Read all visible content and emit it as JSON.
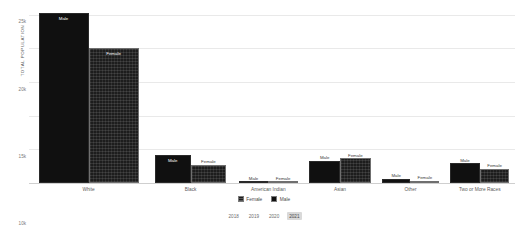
{
  "chart_data": {
    "type": "bar",
    "title": "",
    "xlabel": "",
    "ylabel": "TOTAL POPULATION",
    "ylim": [
      0,
      26000
    ],
    "grid": true,
    "legend_position": "bottom",
    "ytick_labels": [
      "0",
      "5k",
      "10k",
      "15k",
      "20k",
      "25k"
    ],
    "ytick_values": [
      0,
      5000,
      10000,
      15000,
      20000,
      25000
    ],
    "categories": [
      "White",
      "Black",
      "American Indian",
      "Asian",
      "Other",
      "Two or More Races"
    ],
    "series": [
      {
        "name": "Male",
        "values": [
          25300,
          4100,
          90,
          3300,
          620,
          2950
        ]
      },
      {
        "name": "Female",
        "values": [
          20100,
          2700,
          80,
          3700,
          330,
          2150
        ]
      }
    ],
    "bar_label_male": "Male",
    "bar_label_female": "Female"
  },
  "legend": {
    "items": [
      {
        "label": "Female",
        "swatch": "female"
      },
      {
        "label": "Male",
        "swatch": "male"
      }
    ]
  },
  "year_selector": {
    "years": [
      "2018",
      "2019",
      "2020",
      "2021"
    ],
    "selected": "2021"
  }
}
